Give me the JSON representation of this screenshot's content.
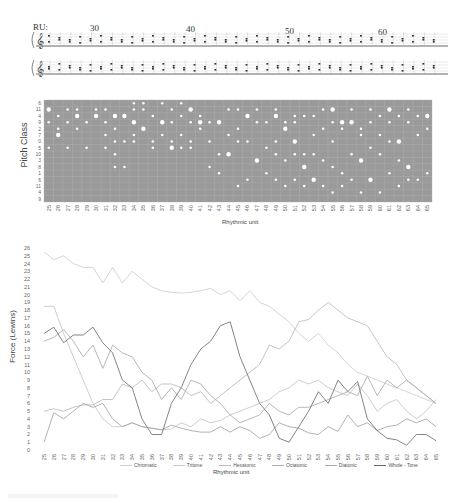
{
  "score": {
    "label": "RU:",
    "measure_numbers": [
      "30",
      "40",
      "50",
      "60"
    ],
    "staves": 2
  },
  "chart_data": [
    {
      "type": "scatter",
      "title": "",
      "xlabel": "Rhythmic unit",
      "ylabel": "Pitch Class",
      "y_tick_labels": [
        "6",
        "11",
        "4",
        "9",
        "2",
        "7",
        "0",
        "5",
        "10",
        "3",
        "8",
        "1",
        "6",
        "11",
        "4",
        "9"
      ],
      "x_tick_labels": [
        "25",
        "26",
        "27",
        "28",
        "29",
        "30",
        "31",
        "32",
        "33",
        "34",
        "35",
        "36",
        "37",
        "38",
        "39",
        "40",
        "41",
        "42",
        "43",
        "44",
        "45",
        "46",
        "47",
        "48",
        "49",
        "50",
        "51",
        "52",
        "53",
        "54",
        "55",
        "56",
        "57",
        "58",
        "59",
        "60",
        "61",
        "62",
        "63",
        "64",
        "65"
      ],
      "background": "#9a9a9a",
      "grid": true,
      "marker_color": "#ffffff"
    },
    {
      "type": "line",
      "title": "",
      "xlabel": "Rhythmic unit",
      "ylabel": "Force (Lewins)",
      "ylim": [
        0,
        26
      ],
      "y_ticks": [
        "0",
        "1",
        "2",
        "3",
        "4",
        "5",
        "6",
        "7",
        "8",
        "9",
        "10",
        "11",
        "12",
        "13",
        "14",
        "15",
        "16",
        "17",
        "18",
        "19",
        "20",
        "21",
        "22",
        "23",
        "24",
        "25",
        "26"
      ],
      "x": [
        "25",
        "26",
        "27",
        "28",
        "29",
        "30",
        "31",
        "32",
        "33",
        "34",
        "35",
        "36",
        "37",
        "38",
        "39",
        "40",
        "41",
        "42",
        "43",
        "44",
        "45",
        "46",
        "47",
        "48",
        "49",
        "50",
        "51",
        "52",
        "53",
        "54",
        "55",
        "56",
        "57",
        "58",
        "59",
        "60",
        "61",
        "62",
        "63",
        "64",
        "65"
      ],
      "grid": false,
      "legend_position": "bottom",
      "series": [
        {
          "name": "Chromatic",
          "color": "#d0d0d0",
          "values": [
            25.5,
            24.5,
            25,
            24,
            23.5,
            23.5,
            21.5,
            23.5,
            21.5,
            23,
            22,
            21,
            20.5,
            20.3,
            20.2,
            20.3,
            20.5,
            20.8,
            20,
            20.5,
            19.2,
            20.5,
            19,
            18.5,
            17.5,
            16.5,
            15,
            14,
            15,
            13.5,
            12.5,
            11,
            10,
            9.5,
            9,
            8.5,
            8,
            7.5,
            7,
            6.5,
            6
          ]
        },
        {
          "name": "Tritone",
          "color": "#c8c8c8",
          "values": [
            18.5,
            18.5,
            15,
            12,
            9,
            6,
            4,
            3,
            3,
            3.5,
            3,
            2.8,
            2.6,
            2.7,
            3.5,
            3,
            4,
            3.5,
            3.8,
            4.5,
            5,
            5.5,
            6,
            6.5,
            7.5,
            8,
            9,
            8.5,
            9,
            8,
            7.5,
            7,
            8.5,
            7,
            5,
            6,
            6.5,
            5,
            4,
            5,
            6.5
          ]
        },
        {
          "name": "Hexatonic",
          "color": "#bdbdbd",
          "values": [
            5,
            5.3,
            5,
            5.5,
            5.8,
            5.8,
            6.5,
            6.5,
            8.5,
            8,
            9,
            7.5,
            8.5,
            8.5,
            8,
            7,
            7.5,
            6,
            7,
            8,
            9,
            10,
            11,
            13.5,
            13,
            14,
            16.5,
            16.8,
            18,
            19,
            18,
            17,
            16.5,
            16,
            14,
            12,
            11,
            9,
            8,
            7,
            6
          ]
        },
        {
          "name": "Octatonic",
          "color": "#b0b0b0",
          "values": [
            14,
            14.5,
            15.5,
            14,
            12,
            13.5,
            10.5,
            13.5,
            12.5,
            12,
            10,
            9,
            6.5,
            8,
            6.5,
            9,
            8.5,
            7,
            6,
            4.5,
            3.5,
            4,
            4.5,
            6,
            5,
            4.5,
            5.5,
            5.5,
            6,
            6.5,
            7,
            7.5,
            7,
            9.5,
            7,
            9,
            8,
            9,
            8,
            7,
            6
          ]
        },
        {
          "name": "Diatonic",
          "color": "#a8a8a8",
          "values": [
            1,
            4.8,
            4,
            5,
            6,
            5.5,
            6,
            4,
            3,
            3.5,
            3,
            2.8,
            2.6,
            3.2,
            2.8,
            2.5,
            2.3,
            2.3,
            3,
            2.3,
            3,
            2.5,
            1.5,
            2,
            3.5,
            3,
            2.8,
            2.2,
            2,
            3,
            2.4,
            4.5,
            3,
            3.5,
            2.5,
            3,
            3.2,
            4,
            3.5,
            4,
            3
          ]
        },
        {
          "name": "Whole - Tone",
          "color": "#666666",
          "values": [
            15,
            15.8,
            13.8,
            14.8,
            14.8,
            15.8,
            13.8,
            12.5,
            9,
            8,
            4,
            2,
            2,
            6,
            8,
            11,
            13,
            14,
            16,
            16.5,
            12,
            9,
            6,
            4.5,
            1.5,
            1,
            3,
            5,
            7.5,
            6,
            9,
            7.5,
            8.8,
            4,
            2.5,
            1.5,
            1.3,
            0.6,
            2,
            2,
            1.2
          ]
        }
      ]
    }
  ],
  "scatter_points": [
    [
      0,
      1
    ],
    [
      0,
      3
    ],
    [
      0,
      7
    ],
    [
      1,
      2
    ],
    [
      1,
      4
    ],
    [
      1,
      5
    ],
    [
      2,
      1
    ],
    [
      2,
      3
    ],
    [
      2,
      7
    ],
    [
      3,
      1
    ],
    [
      3,
      2
    ],
    [
      3,
      4
    ],
    [
      4,
      3
    ],
    [
      4,
      7
    ],
    [
      5,
      1
    ],
    [
      5,
      2
    ],
    [
      6,
      1
    ],
    [
      6,
      3
    ],
    [
      6,
      5
    ],
    [
      6,
      7
    ],
    [
      7,
      2
    ],
    [
      7,
      4
    ],
    [
      7,
      6
    ],
    [
      7,
      8
    ],
    [
      7,
      10
    ],
    [
      8,
      2
    ],
    [
      8,
      6
    ],
    [
      8,
      10
    ],
    [
      9,
      0
    ],
    [
      9,
      1
    ],
    [
      9,
      3
    ],
    [
      9,
      5
    ],
    [
      9,
      6
    ],
    [
      10,
      0
    ],
    [
      10,
      1
    ],
    [
      10,
      4
    ],
    [
      11,
      2
    ],
    [
      11,
      6
    ],
    [
      11,
      7
    ],
    [
      12,
      0
    ],
    [
      12,
      3
    ],
    [
      12,
      5
    ],
    [
      13,
      1
    ],
    [
      13,
      3
    ],
    [
      13,
      6
    ],
    [
      13,
      7
    ],
    [
      14,
      0
    ],
    [
      14,
      2
    ],
    [
      14,
      5
    ],
    [
      14,
      7
    ],
    [
      15,
      1
    ],
    [
      15,
      3
    ],
    [
      15,
      6
    ],
    [
      15,
      7
    ],
    [
      16,
      2
    ],
    [
      16,
      3
    ],
    [
      16,
      4
    ],
    [
      17,
      3
    ],
    [
      17,
      6
    ],
    [
      17,
      10
    ],
    [
      18,
      3
    ],
    [
      18,
      8
    ],
    [
      18,
      11
    ],
    [
      19,
      1
    ],
    [
      19,
      5
    ],
    [
      19,
      8
    ],
    [
      20,
      1
    ],
    [
      20,
      4
    ],
    [
      20,
      6
    ],
    [
      20,
      13
    ],
    [
      21,
      2
    ],
    [
      21,
      6
    ],
    [
      21,
      12
    ],
    [
      22,
      1
    ],
    [
      22,
      3
    ],
    [
      22,
      9
    ],
    [
      23,
      3
    ],
    [
      23,
      7
    ],
    [
      23,
      11
    ],
    [
      24,
      1
    ],
    [
      24,
      2
    ],
    [
      24,
      6
    ],
    [
      24,
      8
    ],
    [
      24,
      12
    ],
    [
      25,
      3
    ],
    [
      25,
      4
    ],
    [
      25,
      9
    ],
    [
      25,
      13
    ],
    [
      26,
      2
    ],
    [
      26,
      3
    ],
    [
      26,
      6
    ],
    [
      26,
      8
    ],
    [
      26,
      12
    ],
    [
      27,
      2
    ],
    [
      27,
      8
    ],
    [
      27,
      10
    ],
    [
      27,
      13
    ],
    [
      28,
      2
    ],
    [
      28,
      5
    ],
    [
      28,
      8
    ],
    [
      28,
      12
    ],
    [
      29,
      1
    ],
    [
      29,
      4
    ],
    [
      29,
      9
    ],
    [
      29,
      13
    ],
    [
      30,
      1
    ],
    [
      30,
      3
    ],
    [
      30,
      6
    ],
    [
      30,
      10
    ],
    [
      30,
      14
    ],
    [
      31,
      3
    ],
    [
      31,
      4
    ],
    [
      31,
      11
    ],
    [
      31,
      13
    ],
    [
      32,
      1
    ],
    [
      32,
      3
    ],
    [
      32,
      8
    ],
    [
      32,
      12
    ],
    [
      33,
      4
    ],
    [
      33,
      5
    ],
    [
      33,
      9
    ],
    [
      33,
      14
    ],
    [
      34,
      1
    ],
    [
      34,
      3
    ],
    [
      34,
      7
    ],
    [
      34,
      12
    ],
    [
      35,
      2
    ],
    [
      35,
      5
    ],
    [
      35,
      8
    ],
    [
      35,
      14
    ],
    [
      36,
      1
    ],
    [
      36,
      3
    ],
    [
      36,
      6
    ],
    [
      36,
      11
    ],
    [
      37,
      2
    ],
    [
      37,
      6
    ],
    [
      37,
      9
    ],
    [
      37,
      13
    ],
    [
      38,
      1
    ],
    [
      38,
      3
    ],
    [
      38,
      10
    ],
    [
      38,
      12
    ],
    [
      39,
      2
    ],
    [
      39,
      5
    ],
    [
      39,
      12
    ],
    [
      40,
      2
    ],
    [
      40,
      4
    ],
    [
      40,
      11
    ]
  ],
  "legend": {
    "items": [
      "Chromatic",
      "Tritone",
      "Hexatonic",
      "Octatonic",
      "Diatonic",
      "Whole - Tone"
    ]
  }
}
